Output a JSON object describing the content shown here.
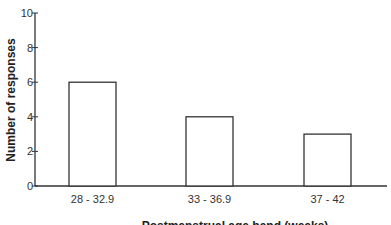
{
  "chart_data": {
    "type": "bar",
    "title": "",
    "xlabel": "Postmenstrual age band (weeks)",
    "ylabel": "Number of responses",
    "categories": [
      "28 - 32.9",
      "33 - 36.9",
      "37 - 42"
    ],
    "values": [
      6,
      4,
      3
    ],
    "ylim": [
      0,
      10
    ],
    "yticks": [
      0,
      2,
      4,
      6,
      8,
      10
    ],
    "grid": false,
    "legend": null,
    "bar_fill": "#ffffff",
    "bar_stroke": "#333333"
  }
}
